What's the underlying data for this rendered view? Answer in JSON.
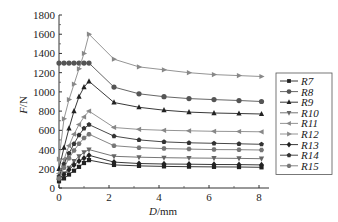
{
  "chart_data": {
    "type": "line",
    "title": "",
    "xlabel": "D/mm",
    "xlabel_italic": "D",
    "xlabel_unit": "/mm",
    "ylabel": "F/N",
    "ylabel_italic": "F",
    "ylabel_unit": "/N",
    "xlim": [
      0,
      8.4
    ],
    "ylim": [
      0,
      1800
    ],
    "xticks": [
      0,
      2,
      4,
      6,
      8
    ],
    "yticks": [
      0,
      200,
      400,
      600,
      800,
      1000,
      1200,
      1400,
      1600,
      1800
    ],
    "grid": false,
    "legend_position": "right",
    "x": [
      0,
      0.2,
      0.4,
      0.6,
      0.8,
      1.0,
      1.2,
      2.2,
      3.2,
      4.2,
      5.2,
      6.2,
      7.2,
      8.1
    ],
    "series": [
      {
        "name": "R7",
        "marker": "square",
        "color": "#222222",
        "values": [
          70,
          100,
          140,
          180,
          220,
          260,
          290,
          240,
          230,
          225,
          222,
          220,
          218,
          215
        ]
      },
      {
        "name": "R8",
        "marker": "circle",
        "color": "#555555",
        "values": [
          1300,
          1300,
          1300,
          1300,
          1300,
          1300,
          1300,
          1050,
          980,
          950,
          930,
          920,
          910,
          900
        ]
      },
      {
        "name": "R9",
        "marker": "triangle-up",
        "color": "#222222",
        "values": [
          200,
          420,
          620,
          800,
          950,
          1050,
          1110,
          890,
          840,
          810,
          790,
          780,
          775,
          770
        ]
      },
      {
        "name": "R10",
        "marker": "triangle-down",
        "color": "#666666",
        "values": [
          90,
          150,
          210,
          280,
          330,
          370,
          400,
          330,
          320,
          315,
          312,
          310,
          308,
          305
        ]
      },
      {
        "name": "R11",
        "marker": "triangle-left",
        "color": "#888888",
        "values": [
          150,
          300,
          440,
          560,
          660,
          740,
          800,
          630,
          610,
          600,
          595,
          590,
          588,
          585
        ]
      },
      {
        "name": "R12",
        "marker": "triangle-right",
        "color": "#888888",
        "values": [
          300,
          720,
          920,
          1080,
          1240,
          1400,
          1600,
          1340,
          1260,
          1230,
          1200,
          1180,
          1170,
          1160
        ]
      },
      {
        "name": "R13",
        "marker": "diamond",
        "color": "#222222",
        "values": [
          90,
          140,
          190,
          240,
          280,
          310,
          340,
          270,
          255,
          250,
          248,
          245,
          243,
          240
        ]
      },
      {
        "name": "R14",
        "marker": "pentagon",
        "color": "#333333",
        "values": [
          120,
          250,
          360,
          460,
          550,
          620,
          660,
          540,
          500,
          480,
          470,
          465,
          460,
          455
        ]
      },
      {
        "name": "R15",
        "marker": "hexagon",
        "color": "#777777",
        "values": [
          100,
          210,
          310,
          390,
          460,
          520,
          560,
          440,
          420,
          410,
          405,
          400,
          398,
          395
        ]
      }
    ]
  }
}
